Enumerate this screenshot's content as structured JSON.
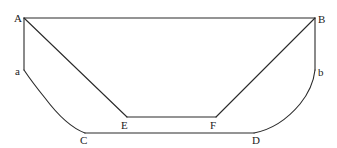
{
  "diagram": {
    "type": "geometric-figure",
    "background": "#ffffff",
    "stroke_color": "#2a2a2a",
    "points": {
      "A": {
        "label": "A",
        "x": 24,
        "y": 18
      },
      "B": {
        "label": "B",
        "x": 315,
        "y": 18
      },
      "a": {
        "label": "a",
        "x": 24,
        "y": 70
      },
      "b": {
        "label": "b",
        "x": 315,
        "y": 70
      },
      "C": {
        "label": "C",
        "x": 85,
        "y": 133
      },
      "D": {
        "label": "D",
        "x": 254,
        "y": 133
      },
      "E": {
        "label": "E",
        "x": 127,
        "y": 117
      },
      "F": {
        "label": "F",
        "x": 216,
        "y": 117
      }
    },
    "edges": [
      {
        "from": "A",
        "to": "B",
        "kind": "straight"
      },
      {
        "from": "A",
        "to": "a",
        "kind": "straight"
      },
      {
        "from": "B",
        "to": "b",
        "kind": "straight"
      },
      {
        "from": "a",
        "to": "C",
        "kind": "curve"
      },
      {
        "from": "b",
        "to": "D",
        "kind": "curve"
      },
      {
        "from": "C",
        "to": "D",
        "kind": "straight"
      },
      {
        "from": "A",
        "to": "E",
        "kind": "straight"
      },
      {
        "from": "B",
        "to": "F",
        "kind": "straight"
      },
      {
        "from": "E",
        "to": "F",
        "kind": "straight"
      }
    ],
    "labels": {
      "A": "A",
      "B": "B",
      "a": "a",
      "b": "b",
      "C": "C",
      "D": "D",
      "E": "E",
      "F": "F"
    }
  }
}
